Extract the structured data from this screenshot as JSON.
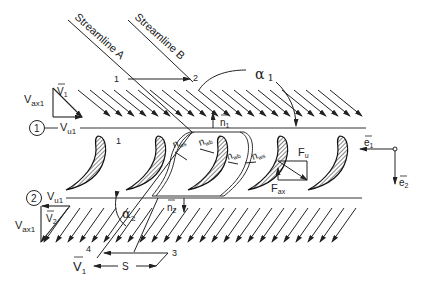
{
  "diagram": {
    "streamlines": [
      {
        "label": "Streamline A"
      },
      {
        "label": "Streamline B"
      }
    ],
    "points": [
      "1",
      "2",
      "3",
      "4"
    ],
    "blade_passage_label": "1",
    "stations": [
      {
        "label": "1",
        "velocity_component": "V",
        "velocity_sub": "u1"
      },
      {
        "label": "2",
        "velocity_component": "V",
        "velocity_sub": "u1"
      }
    ],
    "inlet_triangle": {
      "velocity": "V",
      "velocity_sub": "1",
      "axial": "V",
      "axial_sub": "ax1",
      "tangential": "V",
      "tangential_sub": "u1"
    },
    "outlet_triangle": {
      "velocity": "V",
      "velocity_sub": "2",
      "axial": "V",
      "axial_sub": "ax1"
    },
    "angles": [
      {
        "symbol": "α",
        "sub": "1"
      },
      {
        "symbol": "α",
        "sub": "2"
      }
    ],
    "normals": [
      {
        "symbol": "n",
        "sub": "1"
      },
      {
        "symbol": "n",
        "sub": "2"
      },
      {
        "symbol": "n",
        "sub": "ws"
      },
      {
        "symbol": "n",
        "sub": "wb"
      },
      {
        "symbol": "n",
        "sub": "wb"
      },
      {
        "symbol": "n",
        "sub": "ws"
      }
    ],
    "forces": [
      {
        "symbol": "F",
        "sub": "u"
      },
      {
        "symbol": "F",
        "sub": "ax"
      }
    ],
    "unit_vectors": [
      {
        "symbol": "e",
        "sub": "1"
      },
      {
        "symbol": "e",
        "sub": "2"
      }
    ],
    "pitch_label": "S",
    "exit_velocity": {
      "symbol": "V",
      "sub": "1"
    }
  }
}
